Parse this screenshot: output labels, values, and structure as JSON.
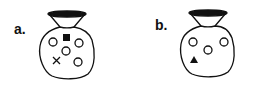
{
  "panels": [
    {
      "label": "a.",
      "contents": [
        "filled-square",
        "open-circle",
        "open-circle",
        "open-circle",
        "open-circle",
        "cross"
      ]
    },
    {
      "label": "b.",
      "contents": [
        "open-circle",
        "open-circle",
        "open-circle",
        "filled-triangle"
      ]
    }
  ],
  "colors": {
    "stroke": "#111111",
    "fill": "#111111",
    "background": "#ffffff"
  }
}
